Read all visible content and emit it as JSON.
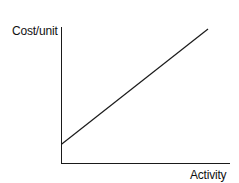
{
  "chart_data": {
    "type": "line",
    "title": "",
    "xlabel": "Activity",
    "ylabel": "Cost/unit",
    "series": [
      {
        "name": "Cost/unit",
        "x": [
          0,
          1
        ],
        "y": [
          0.14,
          1.0
        ]
      }
    ],
    "xlim": [
      0,
      1.15
    ],
    "ylim": [
      0,
      1.0
    ],
    "grid": false,
    "legend": "none",
    "ticks": "none"
  }
}
